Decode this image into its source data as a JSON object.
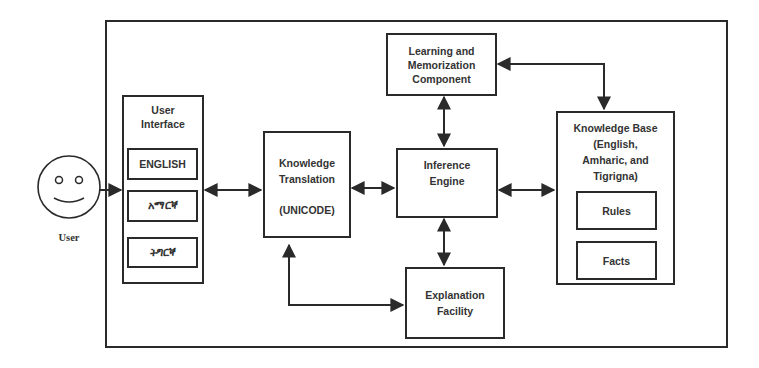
{
  "diagram": {
    "actor": {
      "label": "User",
      "icon": "smiley-face-icon"
    },
    "user_interface": {
      "title_line1": "User",
      "title_line2": "Interface",
      "languages": [
        "ENGLISH",
        "አማርኛ",
        "ትግርኛ"
      ]
    },
    "knowledge_translation": {
      "line1": "Knowledge",
      "line2": "Translation",
      "line3": "(UNICODE)"
    },
    "learning_component": {
      "line1": "Learning and",
      "line2": "Memorization",
      "line3": "Component"
    },
    "inference_engine": {
      "line1": "Inference",
      "line2": "Engine"
    },
    "explanation_facility": {
      "line1": "Explanation",
      "line2": "Facility"
    },
    "knowledge_base": {
      "line1": "Knowledge Base",
      "line2": "(English,",
      "line3": "Amharic, and",
      "line4": "Tigrigna)",
      "items": [
        "Rules",
        "Facts"
      ]
    },
    "connections": [
      {
        "from": "User",
        "to": "User Interface",
        "type": "one-way"
      },
      {
        "from": "User Interface",
        "to": "Knowledge Translation",
        "type": "two-way"
      },
      {
        "from": "Knowledge Translation",
        "to": "Inference Engine",
        "type": "two-way"
      },
      {
        "from": "Knowledge Translation",
        "to": "Explanation Facility",
        "type": "two-way"
      },
      {
        "from": "Inference Engine",
        "to": "Learning and Memorization Component",
        "type": "two-way"
      },
      {
        "from": "Inference Engine",
        "to": "Explanation Facility",
        "type": "two-way"
      },
      {
        "from": "Inference Engine",
        "to": "Knowledge Base",
        "type": "two-way"
      },
      {
        "from": "Learning and Memorization Component",
        "to": "Knowledge Base",
        "type": "two-way"
      }
    ],
    "colors": {
      "stroke": "#2a2a2a",
      "background": "#ffffff",
      "text": "#333333"
    }
  }
}
